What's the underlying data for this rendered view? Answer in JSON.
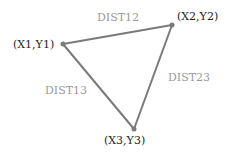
{
  "diagram": {
    "type": "triangle",
    "colors": {
      "edge": "#7a7a7a",
      "point_label": "#222222",
      "edge_label": "#9a9a9a"
    },
    "vertices": [
      {
        "id": "p1",
        "label": "(X1,Y1)",
        "x": 63,
        "y": 44
      },
      {
        "id": "p2",
        "label": "(X2,Y2)",
        "x": 172,
        "y": 25
      },
      {
        "id": "p3",
        "label": "(X3,Y3)",
        "x": 134,
        "y": 129
      }
    ],
    "edges": [
      {
        "from": "p1",
        "to": "p2",
        "label": "DIST12"
      },
      {
        "from": "p2",
        "to": "p3",
        "label": "DIST23"
      },
      {
        "from": "p1",
        "to": "p3",
        "label": "DIST13"
      }
    ]
  }
}
